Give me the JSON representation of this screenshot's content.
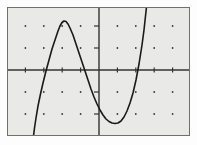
{
  "screen": {
    "width": 197,
    "height": 145,
    "background_color": "#fdfdfd",
    "label": "graphing calculator plot screen"
  },
  "plot": {
    "label": "function graph viewport",
    "background_color": "#e9e9e7",
    "border_color": "#6f6f6f",
    "frame": {
      "x": 7,
      "y": 7,
      "width": 183,
      "height": 129
    }
  },
  "chart_data": {
    "type": "line",
    "title": "",
    "subtitle": "",
    "xlabel": "",
    "ylabel": "",
    "grid": true,
    "grid_style": "dot-grid",
    "legend": "none",
    "axes": {
      "x_axis_visible": true,
      "y_axis_visible": true,
      "axis_color": "#333333",
      "x_axis_pixel_y": 70,
      "y_axis_pixel_x": 99,
      "origin_pixel": [
        99,
        70
      ]
    },
    "xlim": [
      -5,
      5
    ],
    "ylim": [
      -3,
      3
    ],
    "xtick_step": 1,
    "ytick_step": 1,
    "xticks": [
      -5,
      -4,
      -3,
      -2,
      -1,
      0,
      1,
      2,
      3,
      4,
      5
    ],
    "yticks": [
      -3,
      -2,
      -1,
      0,
      1,
      2,
      3
    ],
    "xtick_labels": [
      "",
      "",
      "",
      "",
      "",
      "",
      "",
      "",
      "",
      "",
      ""
    ],
    "ytick_labels": [
      "",
      "",
      "",
      "",
      "",
      "",
      ""
    ],
    "tick_mark_length": 5,
    "grid_dot_spacing_x": 18.4,
    "grid_dot_spacing_y": 22.0,
    "grid_dot_color": "#3a3a3a",
    "grid_dot_radius": 0.9,
    "series": [
      {
        "name": "cubic curve",
        "color": "#1a1a1a",
        "line_width": 1.6,
        "points_pixel": [
          [
            33.5,
            136
          ],
          [
            34.5,
            128
          ],
          [
            36,
            118
          ],
          [
            38,
            106
          ],
          [
            40.5,
            94
          ],
          [
            43,
            83
          ],
          [
            46,
            71
          ],
          [
            49,
            60
          ],
          [
            52,
            49
          ],
          [
            55,
            40
          ],
          [
            58,
            31
          ],
          [
            60,
            26
          ],
          [
            62,
            22.5
          ],
          [
            64,
            21
          ],
          [
            66,
            21.5
          ],
          [
            68,
            24
          ],
          [
            70,
            28
          ],
          [
            73,
            35
          ],
          [
            76,
            44
          ],
          [
            79,
            53
          ],
          [
            82,
            62
          ],
          [
            85,
            71
          ],
          [
            88,
            80
          ],
          [
            91,
            89
          ],
          [
            94,
            97
          ],
          [
            97,
            104
          ],
          [
            100,
            110
          ],
          [
            103,
            115
          ],
          [
            106,
            119
          ],
          [
            109,
            121.5
          ],
          [
            112,
            123
          ],
          [
            115,
            123.5
          ],
          [
            118,
            123
          ],
          [
            121,
            121
          ],
          [
            124,
            117
          ],
          [
            127,
            111
          ],
          [
            130,
            103
          ],
          [
            133,
            93
          ],
          [
            136,
            80
          ],
          [
            139,
            64
          ],
          [
            142,
            45
          ],
          [
            144,
            30
          ],
          [
            145.5,
            16
          ],
          [
            146.5,
            7
          ]
        ],
        "features": {
          "local_max_pixel": [
            64,
            21
          ],
          "local_min_pixel": [
            116,
            123.5
          ],
          "x_intercepts_pixel": [
            [
              46,
              70
            ],
            [
              85,
              70
            ],
            [
              134,
              70
            ]
          ],
          "enters_bottom_left_pixel_x": 33.5,
          "exits_top_right_pixel_x": 146.5
        }
      }
    ]
  }
}
